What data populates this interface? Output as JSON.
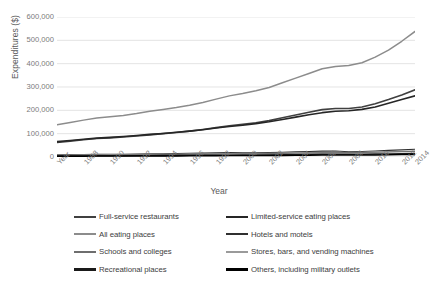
{
  "chart_data": {
    "type": "line",
    "title": "",
    "xlabel": "Year",
    "ylabel": "Expenditures ($)",
    "ylim": [
      0,
      600000
    ],
    "ytick_values": [
      600000,
      500000,
      400000,
      300000,
      200000,
      100000,
      0
    ],
    "ytick_labels": [
      "600,000",
      "500,000",
      "400,000",
      "300,000",
      "200,000",
      "100,000",
      "0"
    ],
    "grid": true,
    "legend_position": "bottom",
    "x_axis_first_label": "Year",
    "categories": [
      1987,
      1988,
      1989,
      1990,
      1991,
      1992,
      1993,
      1994,
      1995,
      1996,
      1997,
      1998,
      1999,
      2000,
      2001,
      2002,
      2003,
      2004,
      2005,
      2006,
      2007,
      2008,
      2009,
      2010,
      2011,
      2012,
      2013,
      2014
    ],
    "xtick_labels": [
      "Year",
      "1988",
      "1990",
      "1992",
      "1994",
      "1996",
      "1998",
      "2000",
      "2002",
      "2004",
      "2006",
      "2008",
      "2010",
      "2012",
      "2014"
    ],
    "series": [
      {
        "name": "All eating places",
        "color": "#8c8c8c",
        "width": 1.5,
        "values": [
          138000,
          148000,
          158000,
          167000,
          172000,
          178000,
          186000,
          196000,
          204000,
          212000,
          222000,
          234000,
          248000,
          262000,
          272000,
          284000,
          298000,
          318000,
          338000,
          358000,
          378000,
          388000,
          392000,
          404000,
          428000,
          458000,
          496000,
          538000
        ]
      },
      {
        "name": "Full-service restaurants",
        "color": "#404040",
        "width": 1.6,
        "values": [
          62000,
          68000,
          74000,
          79000,
          82000,
          86000,
          90000,
          95000,
          100000,
          105000,
          111000,
          118000,
          126000,
          134000,
          140000,
          147000,
          156000,
          168000,
          180000,
          192000,
          203000,
          208000,
          208000,
          214000,
          228000,
          246000,
          266000,
          288000
        ]
      },
      {
        "name": "Limited-service eating places",
        "color": "#262626",
        "width": 1.6,
        "values": [
          66000,
          71000,
          76000,
          81000,
          84000,
          88000,
          92000,
          97000,
          101000,
          106000,
          111000,
          117000,
          124000,
          131000,
          136000,
          143000,
          151000,
          161000,
          171000,
          181000,
          190000,
          196000,
          198000,
          204000,
          214000,
          230000,
          246000,
          262000
        ]
      },
      {
        "name": "Hotels and motels",
        "color": "#303030",
        "width": 1.1,
        "values": [
          9000,
          10000,
          10800,
          11400,
          11500,
          11800,
          12400,
          13200,
          14000,
          14800,
          15800,
          16800,
          17800,
          18800,
          18200,
          18000,
          18800,
          20400,
          22000,
          23600,
          25200,
          25400,
          22800,
          23800,
          26000,
          28200,
          30400,
          33000
        ]
      },
      {
        "name": "Stores, bars, and vending machines",
        "color": "#9a9a9a",
        "width": 1.1,
        "values": [
          8200,
          8800,
          9300,
          9800,
          10000,
          10300,
          10700,
          11200,
          11600,
          12000,
          12500,
          13100,
          13800,
          14500,
          14800,
          15200,
          15800,
          16700,
          17700,
          18700,
          19600,
          20000,
          19600,
          20200,
          21400,
          22800,
          24200,
          25800
        ]
      },
      {
        "name": "Schools and colleges",
        "color": "#6e6e6e",
        "width": 1.1,
        "values": [
          7000,
          7400,
          7900,
          8400,
          8700,
          9000,
          9400,
          9900,
          10300,
          10800,
          11300,
          11900,
          12500,
          13100,
          13500,
          14000,
          14600,
          15400,
          16200,
          17000,
          17800,
          18400,
          18600,
          19200,
          20200,
          21400,
          22600,
          24000
        ]
      },
      {
        "name": "Recreational places",
        "color": "#1a1a1a",
        "width": 1.4,
        "values": [
          4200,
          4500,
          4800,
          5100,
          5200,
          5400,
          5700,
          6000,
          6300,
          6600,
          7000,
          7400,
          7800,
          8200,
          8400,
          8700,
          9100,
          9700,
          10300,
          10900,
          11500,
          11800,
          11600,
          12000,
          12800,
          13600,
          14600,
          15600
        ]
      },
      {
        "name": "Others, including military outlets",
        "color": "#000000",
        "width": 1.4,
        "values": [
          3000,
          3200,
          3400,
          3600,
          3700,
          3800,
          4000,
          4200,
          4400,
          4600,
          4800,
          5100,
          5400,
          5700,
          5800,
          6000,
          6300,
          6700,
          7100,
          7500,
          7900,
          8100,
          8000,
          8300,
          8800,
          9400,
          10000,
          10700
        ]
      }
    ]
  },
  "legend": {
    "items": [
      {
        "label": "Full-service restaurants",
        "color": "#404040",
        "thickness": 2.2
      },
      {
        "label": "Limited-service eating places",
        "color": "#262626",
        "thickness": 2.2
      },
      {
        "label": "All eating places",
        "color": "#8c8c8c",
        "thickness": 1.8
      },
      {
        "label": "Hotels and motels",
        "color": "#303030",
        "thickness": 2.4
      },
      {
        "label": "Schools and colleges",
        "color": "#6e6e6e",
        "thickness": 1.8
      },
      {
        "label": "Stores, bars, and vending machines",
        "color": "#9a9a9a",
        "thickness": 1.8
      },
      {
        "label": "Recreational places",
        "color": "#1a1a1a",
        "thickness": 2.6
      },
      {
        "label": "Others, including military outlets",
        "color": "#000000",
        "thickness": 2.6
      }
    ]
  },
  "colors": {
    "gridline": "#d9d9d9",
    "tick_text": "#7a7a7a",
    "axis_title": "#595959",
    "background": "#ffffff"
  }
}
